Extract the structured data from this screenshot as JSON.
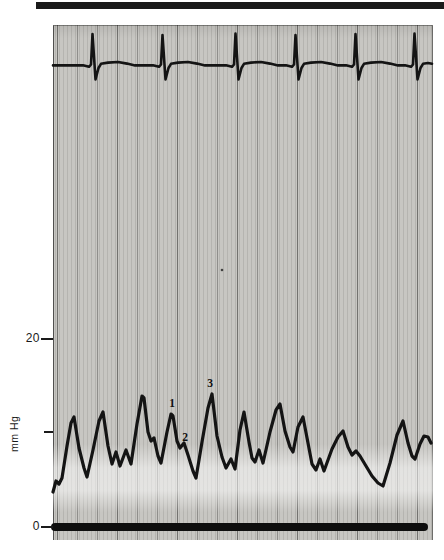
{
  "page": {
    "background": "#ffffff"
  },
  "header_bar": {
    "color": "#1a1a1a"
  },
  "figure": {
    "paper_color": "#c7c6c2",
    "trace_color": "#141414",
    "ylabel": "mm Hg"
  },
  "chart_data": {
    "type": "line",
    "title": "",
    "xlabel": "",
    "ylabel": "mm Hg",
    "y_unit": "mm Hg",
    "y_scale_px_per_mmhg": 9.5,
    "zero_y_px": 527,
    "ylim_mmhg": [
      0,
      53
    ],
    "grid": {
      "orientation": "vertical",
      "minor_spacing_px": 4,
      "major_spacing_px": 20
    },
    "y_ticks": [
      {
        "label": "20",
        "mmhg": 20,
        "y_px": 339
      },
      {
        "label": "",
        "mmhg": 10,
        "y_px": 432
      },
      {
        "label": "0",
        "mmhg": 0,
        "y_px": 527
      }
    ],
    "annotations": [
      {
        "label": "1",
        "x_px": 172,
        "y_px": 403
      },
      {
        "label": "2",
        "x_px": 185,
        "y_px": 437
      },
      {
        "label": "3",
        "x_px": 210,
        "y_px": 383
      }
    ],
    "baseline_bar": {
      "y_px": 527,
      "x1_px": 55,
      "x2_px": 424,
      "thickness_px": 8
    },
    "speck": {
      "x_px": 222,
      "y_px": 270
    },
    "series": [
      {
        "name": "ecg_lead",
        "kind": "ecg",
        "stroke_width": 2.6,
        "baseline_y_px": 65,
        "qrs_x_px": [
          93,
          163,
          236,
          296,
          356,
          415
        ],
        "points_px": [
          [
            53,
            65.4
          ],
          [
            83,
            65.3
          ],
          [
            89,
            66.8
          ],
          [
            91,
            64.5
          ],
          [
            92.5,
            34
          ],
          [
            95.5,
            79.5
          ],
          [
            98.5,
            68
          ],
          [
            101,
            63.8
          ],
          [
            108,
            62.6
          ],
          [
            118,
            62
          ],
          [
            127,
            63.6
          ],
          [
            135,
            65.4
          ],
          [
            153,
            65.3
          ],
          [
            159,
            66.8
          ],
          [
            161,
            64.5
          ],
          [
            162.5,
            35
          ],
          [
            165.5,
            79.5
          ],
          [
            168.5,
            68
          ],
          [
            171,
            63.8
          ],
          [
            178,
            62.6
          ],
          [
            188,
            62
          ],
          [
            197,
            63.6
          ],
          [
            205,
            65.4
          ],
          [
            226,
            65.3
          ],
          [
            232,
            66.8
          ],
          [
            234,
            64.5
          ],
          [
            235.5,
            33.5
          ],
          [
            238.5,
            79.5
          ],
          [
            241.5,
            68
          ],
          [
            244,
            63.8
          ],
          [
            251,
            62.6
          ],
          [
            261,
            62
          ],
          [
            270,
            63.6
          ],
          [
            278,
            65.4
          ],
          [
            286,
            65.3
          ],
          [
            292,
            66.8
          ],
          [
            294,
            64.5
          ],
          [
            295.5,
            35
          ],
          [
            298.5,
            79.5
          ],
          [
            301.5,
            68
          ],
          [
            304,
            63.8
          ],
          [
            311,
            62.6
          ],
          [
            321,
            62
          ],
          [
            330,
            63.6
          ],
          [
            338,
            65.4
          ],
          [
            346,
            65.3
          ],
          [
            352,
            66.8
          ],
          [
            354,
            64.5
          ],
          [
            355.5,
            34
          ],
          [
            358.5,
            79.5
          ],
          [
            361.5,
            68
          ],
          [
            364,
            63.8
          ],
          [
            371,
            62.6
          ],
          [
            381,
            62
          ],
          [
            390,
            63.6
          ],
          [
            398,
            65.4
          ],
          [
            405,
            65.3
          ],
          [
            411,
            66.8
          ],
          [
            413,
            64.5
          ],
          [
            414.5,
            33.5
          ],
          [
            417.5,
            79.5
          ],
          [
            420.5,
            68
          ],
          [
            423,
            63.8
          ],
          [
            428,
            63
          ],
          [
            432,
            63.8
          ]
        ]
      },
      {
        "name": "atrial_pressure",
        "kind": "pressure",
        "unit": "mm Hg",
        "stroke_width": 3.2,
        "peak_mmhg": [
          11.6,
          12.1,
          13.8,
          11.9,
          14.0,
          12.1,
          12.9,
          11.6,
          10.1,
          11.2
        ],
        "trough_min_mmhg": 4.3,
        "points_px": [
          [
            53,
            492
          ],
          [
            56,
            481
          ],
          [
            59,
            484
          ],
          [
            62,
            478
          ],
          [
            67,
            446
          ],
          [
            71,
            423
          ],
          [
            74,
            417
          ],
          [
            79,
            448
          ],
          [
            84,
            468
          ],
          [
            87,
            477
          ],
          [
            93,
            450
          ],
          [
            99,
            421
          ],
          [
            103,
            412
          ],
          [
            108,
            446
          ],
          [
            112,
            464
          ],
          [
            116,
            452
          ],
          [
            120,
            466
          ],
          [
            126,
            450
          ],
          [
            131,
            464
          ],
          [
            137,
            424
          ],
          [
            142,
            396
          ],
          [
            144,
            398
          ],
          [
            148,
            432
          ],
          [
            151,
            441
          ],
          [
            154,
            438
          ],
          [
            158,
            456
          ],
          [
            161,
            463
          ],
          [
            167,
            432
          ],
          [
            171,
            414
          ],
          [
            173,
            416
          ],
          [
            177,
            441
          ],
          [
            180,
            448
          ],
          [
            184,
            443
          ],
          [
            188,
            455
          ],
          [
            193,
            471
          ],
          [
            196,
            478
          ],
          [
            202,
            442
          ],
          [
            208,
            408
          ],
          [
            212,
            394
          ],
          [
            217,
            436
          ],
          [
            222,
            457
          ],
          [
            226,
            468
          ],
          [
            231,
            459
          ],
          [
            235,
            469
          ],
          [
            240,
            430
          ],
          [
            244,
            412
          ],
          [
            249,
            442
          ],
          [
            252,
            458
          ],
          [
            255,
            462
          ],
          [
            259,
            450
          ],
          [
            263,
            463
          ],
          [
            270,
            432
          ],
          [
            276,
            410
          ],
          [
            280,
            404
          ],
          [
            285,
            431
          ],
          [
            290,
            447
          ],
          [
            293,
            452
          ],
          [
            298,
            427
          ],
          [
            303,
            417
          ],
          [
            308,
            443
          ],
          [
            312,
            464
          ],
          [
            316,
            470
          ],
          [
            320,
            459
          ],
          [
            324,
            471
          ],
          [
            332,
            449
          ],
          [
            338,
            437
          ],
          [
            343,
            431
          ],
          [
            348,
            447
          ],
          [
            352,
            455
          ],
          [
            356,
            451
          ],
          [
            360,
            456
          ],
          [
            366,
            466
          ],
          [
            372,
            476
          ],
          [
            378,
            483
          ],
          [
            383,
            486
          ],
          [
            390,
            463
          ],
          [
            397,
            435
          ],
          [
            403,
            421
          ],
          [
            408,
            443
          ],
          [
            412,
            456
          ],
          [
            415,
            459
          ],
          [
            420,
            444
          ],
          [
            424,
            436
          ],
          [
            428,
            437
          ],
          [
            431,
            443
          ]
        ]
      }
    ]
  }
}
